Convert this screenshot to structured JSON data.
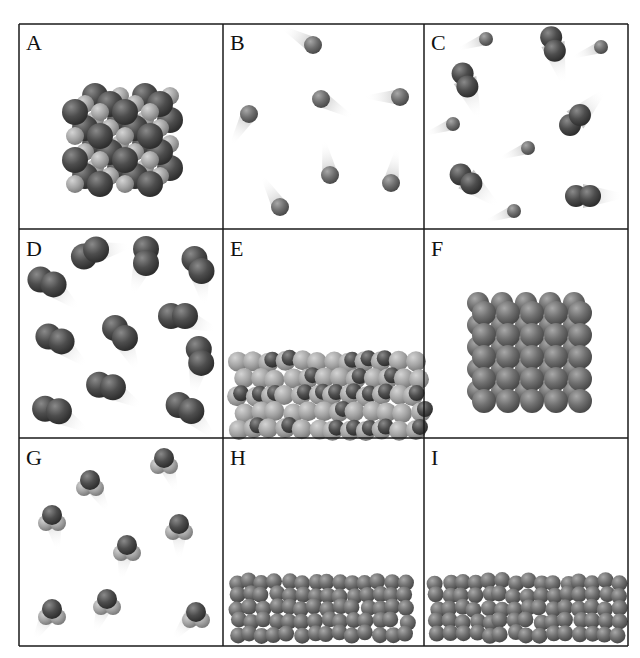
{
  "figure": {
    "grid": {
      "left": 19,
      "top": 24,
      "right": 628,
      "bottom": 646,
      "col_x": [
        19,
        223,
        424,
        628
      ],
      "row_y": [
        24,
        229,
        438,
        646
      ],
      "line_color": "#1a1a1a"
    },
    "colors": {
      "dark_atom": "#4a4a4a",
      "mid_atom": "#6e6e6e",
      "light_atom": "#a6a6a6",
      "trail": "#c8c8c8"
    },
    "panels": [
      {
        "id": "A",
        "label": "A",
        "state": "solid-ionic-lattice"
      },
      {
        "id": "B",
        "label": "B",
        "state": "monatomic-gas",
        "atoms": [
          [
            313,
            45
          ],
          [
            321,
            99
          ],
          [
            249,
            114
          ],
          [
            400,
            97
          ],
          [
            330,
            175
          ],
          [
            391,
            183
          ],
          [
            280,
            207
          ]
        ]
      },
      {
        "id": "C",
        "label": "C",
        "state": "mixture-gas"
      },
      {
        "id": "D",
        "label": "D",
        "state": "diatomic-gas"
      },
      {
        "id": "E",
        "label": "E",
        "state": "molecular-liquid"
      },
      {
        "id": "F",
        "label": "F",
        "state": "atomic-solid"
      },
      {
        "id": "G",
        "label": "G",
        "state": "triatomic-gas"
      },
      {
        "id": "H",
        "label": "H",
        "state": "atomic-liquid"
      },
      {
        "id": "I",
        "label": "I",
        "state": "atomic-liquid"
      }
    ]
  }
}
